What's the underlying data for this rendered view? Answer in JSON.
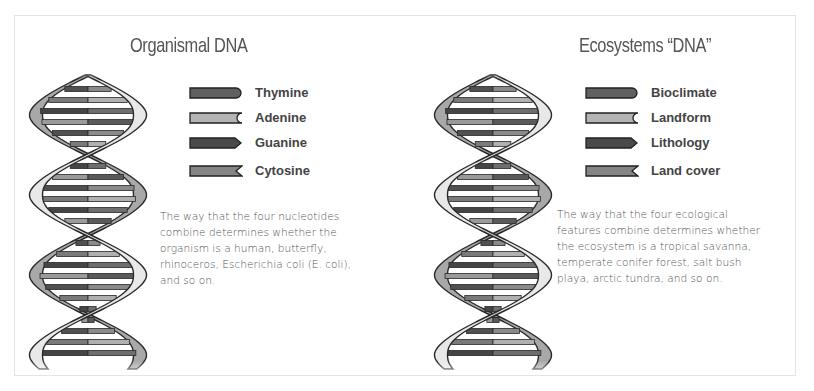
{
  "panels": [
    {
      "title": "Organismal DNA",
      "legend": [
        {
          "label": "Thymine",
          "shape": "rounded-end",
          "fill": "#606060"
        },
        {
          "label": "Adenine",
          "shape": "concave-notch",
          "fill": "#b4b4b4"
        },
        {
          "label": "Guanine",
          "shape": "pointed-end",
          "fill": "#4a4a4a"
        },
        {
          "label": "Cytosine",
          "shape": "v-notch",
          "fill": "#858585"
        }
      ],
      "description_lines": [
        "The way that the four nucleotides",
        "combine determines whether the",
        "organism is a human, butterfly,",
        "rhinoceros, Escherichia coli (E. coli),",
        "and so on."
      ]
    },
    {
      "title": "Ecosystems “DNA”",
      "legend": [
        {
          "label": "Bioclimate",
          "shape": "rounded-end",
          "fill": "#606060"
        },
        {
          "label": "Landform",
          "shape": "concave-notch",
          "fill": "#b4b4b4"
        },
        {
          "label": "Lithology",
          "shape": "pointed-end",
          "fill": "#4a4a4a"
        },
        {
          "label": "Land cover",
          "shape": "v-notch",
          "fill": "#858585"
        }
      ],
      "description_lines": [
        "The way that the four ecological",
        "features combine determines whether",
        "the ecosystem is a tropical savanna,",
        "temperate conifer forest, salt bush",
        "playa, arctic tundra, and so on."
      ]
    }
  ],
  "colors": {
    "front_strand": "#e8e8e8",
    "back_strand": "#a8a8a8",
    "outline": "#2a2a2a",
    "title_text": "#555555",
    "label_text": "#444444",
    "frame_border": "#e4e4e4"
  }
}
